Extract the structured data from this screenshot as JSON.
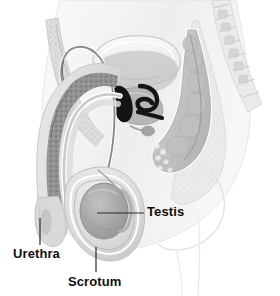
{
  "figure": {
    "kind": "medical-illustration",
    "style": "grayscale line-and-wash anatomical drawing",
    "width": 280,
    "height": 296,
    "background_color": "#ffffff",
    "label_color": "#100f10",
    "leader_line_color": "#2b2b2b"
  },
  "labels": [
    {
      "id": "urethra",
      "text": "Urethra",
      "text_x": 13,
      "text_y": 247,
      "leader": {
        "type": "vertical",
        "x1": 40,
        "y1": 218,
        "x2": 40,
        "y2": 245
      }
    },
    {
      "id": "scrotum",
      "text": "Scrotum",
      "text_x": 68,
      "text_y": 275,
      "leader": {
        "type": "vertical",
        "x1": 96,
        "y1": 247,
        "x2": 96,
        "y2": 272
      }
    },
    {
      "id": "testis",
      "text": "Testis",
      "text_x": 147,
      "text_y": 205,
      "leader": {
        "type": "horizontal",
        "x1": 97,
        "y1": 213,
        "x2": 144,
        "y2": 213
      }
    }
  ],
  "anatomy_parts": [
    {
      "name": "abdominal-wall",
      "tone": "#e2e2e2"
    },
    {
      "name": "pubic-bone",
      "tone": "#cfcfcf"
    },
    {
      "name": "bladder",
      "tone": "#f2f2f2"
    },
    {
      "name": "prostate",
      "tone": "#b6b6b6"
    },
    {
      "name": "seminal-vesicle",
      "tone": "#1a1a1a"
    },
    {
      "name": "ejaculatory-duct",
      "tone": "#1a1a1a"
    },
    {
      "name": "vas-deferens",
      "tone": "#8a8a8a"
    },
    {
      "name": "penis-shaft",
      "tone": "#dedede"
    },
    {
      "name": "corpus-cavernosum",
      "tone": "#8f8f8f"
    },
    {
      "name": "urethra-canal",
      "tone": "#cdcdcd"
    },
    {
      "name": "glans-penis",
      "tone": "#d6d6d6"
    },
    {
      "name": "scrotum-sac",
      "tone": "#dcdcdc"
    },
    {
      "name": "testis-body",
      "tone": "#a9a9a9"
    },
    {
      "name": "epididymis",
      "tone": "#bdbdbd"
    },
    {
      "name": "rectum",
      "tone": "#c9c9c9"
    },
    {
      "name": "sacrum-vertebrae",
      "tone": "#dadada"
    },
    {
      "name": "buttock-outline",
      "tone": "#f0f0f0"
    },
    {
      "name": "thigh-outline",
      "tone": "#f4f4f4"
    }
  ]
}
